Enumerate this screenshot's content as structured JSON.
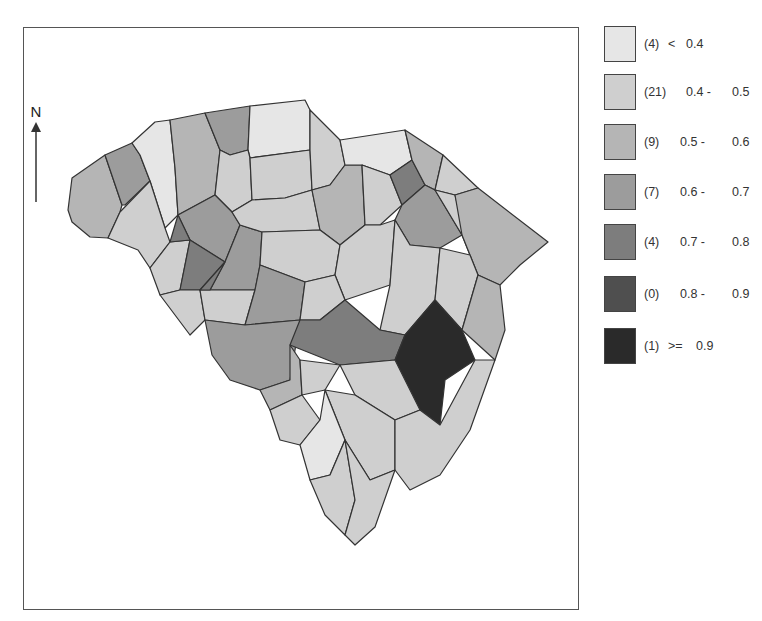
{
  "map": {
    "north_label": "N",
    "colors": {
      "c1": "#e6e6e6",
      "c2": "#cfcfcf",
      "c3": "#b5b5b5",
      "c4": "#9c9c9c",
      "c5": "#7d7d7d",
      "c6": "#4f4f4f",
      "c7": "#2a2a2a"
    }
  },
  "legend": {
    "items": [
      {
        "count": "(4)",
        "op": "<",
        "lo": "0.4",
        "hi": "",
        "color": "#e6e6e6"
      },
      {
        "count": "(21)",
        "op": "",
        "lo": "0.4 -",
        "hi": "0.5",
        "color": "#cfcfcf"
      },
      {
        "count": "(9)",
        "op": "",
        "lo": "0.5 -",
        "hi": "0.6",
        "color": "#b5b5b5"
      },
      {
        "count": "(7)",
        "op": "",
        "lo": "0.6 -",
        "hi": "0.7",
        "color": "#9c9c9c"
      },
      {
        "count": "(4)",
        "op": "",
        "lo": "0.7 -",
        "hi": "0.8",
        "color": "#7d7d7d"
      },
      {
        "count": "(0)",
        "op": "",
        "lo": "0.8 -",
        "hi": "0.9",
        "color": "#4f4f4f"
      },
      {
        "count": "(1)",
        "op": ">=",
        "lo": "0.9",
        "hi": "",
        "color": "#2a2a2a"
      }
    ]
  }
}
